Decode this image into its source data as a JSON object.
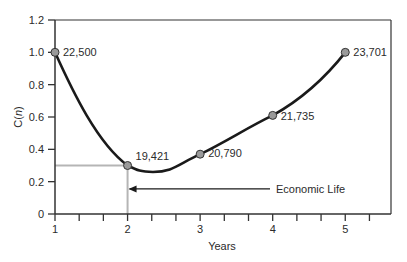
{
  "chart_data": {
    "type": "line",
    "title": "",
    "xlabel": "Years",
    "ylabel_prefix": "C(",
    "ylabel_var": "n",
    "ylabel_suffix": ")",
    "xlim": [
      1,
      5.63
    ],
    "ylim": [
      0,
      1.2
    ],
    "x_ticks": [
      1,
      2,
      3,
      4,
      5
    ],
    "x_tick_labels": [
      "1",
      "2",
      "3",
      "4",
      "5"
    ],
    "x_minor_step": 0.3333,
    "y_ticks": [
      0,
      0.2,
      0.4,
      0.6,
      0.8,
      1.0,
      1.2
    ],
    "y_tick_labels": [
      "0",
      "0.2",
      "0.4",
      "0.6",
      "0.8",
      "1.0",
      "1.2"
    ],
    "grid": false,
    "legend": null,
    "series": [
      {
        "name": "C(n)",
        "points": [
          {
            "x": 1,
            "y": 1.0,
            "label": "22,500"
          },
          {
            "x": 2,
            "y": 0.3,
            "label": "19,421"
          },
          {
            "x": 3,
            "y": 0.37,
            "label": "20,790"
          },
          {
            "x": 4,
            "y": 0.61,
            "label": "21,735"
          },
          {
            "x": 5,
            "y": 1.0,
            "label": "23,701"
          }
        ],
        "curve_min": {
          "x": 2.35,
          "y": 0.26
        }
      }
    ],
    "annotations": [
      {
        "text": "Economic Life",
        "arrow_to_x": 2,
        "at_y": 0.155
      },
      {
        "type": "reference_lines",
        "x": 2,
        "y": 0.3,
        "color": "#b0b0b0"
      }
    ]
  },
  "colors": {
    "line": "#1a1a1a",
    "marker_fill": "#9a9a9a",
    "marker_stroke": "#333333",
    "reference": "#b5b5b5",
    "axis": "#333333"
  }
}
